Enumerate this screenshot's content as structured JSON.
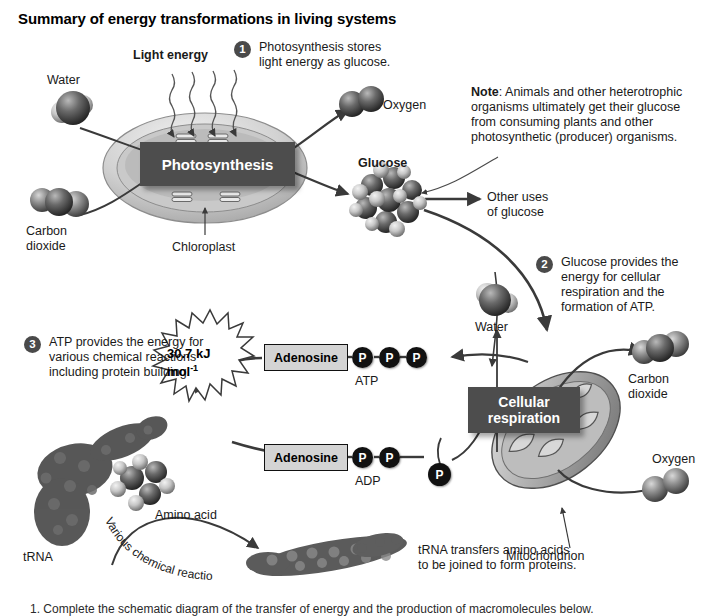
{
  "title": "Summary of energy transformations in living systems",
  "labels": {
    "light_energy": "Light energy",
    "water_top": "Water",
    "carbon_dioxide_top": "Carbon\ndioxide",
    "carbon_dioxide_top_l1": "Carbon",
    "carbon_dioxide_top_l2": "dioxide",
    "photosynthesis": "Photosynthesis",
    "chloroplast": "Chloroplast",
    "oxygen_top": "Oxygen",
    "glucose": "Glucose",
    "other_uses_l1": "Other uses",
    "other_uses_l2": "of glucose",
    "water_mid": "Water",
    "cellular_respiration_l1": "Cellular",
    "cellular_respiration_l2": "respiration",
    "mitochondrion": "Mitochondrion",
    "carbon_dioxide_right_l1": "Carbon",
    "carbon_dioxide_right_l2": "dioxide",
    "oxygen_right": "Oxygen",
    "adenosine_atp": "Adenosine",
    "adenosine_adp": "Adenosine",
    "atp": "ATP",
    "adp": "ADP",
    "phosphate": "P",
    "energy_value_l1": "30.7 kJ",
    "energy_value_l2": "mol",
    "energy_value_sup": "-1",
    "trna": "tRNA",
    "amino_acid": "Amino acid",
    "various_reactions": "Various chemical reactions"
  },
  "steps": [
    {
      "num": "1",
      "lines": [
        "Photosynthesis stores",
        "light energy as glucose."
      ]
    },
    {
      "num": "2",
      "lines": [
        "Glucose provides the",
        "energy for cellular",
        "respiration and the",
        "formation of ATP."
      ]
    },
    {
      "num": "3",
      "lines": [
        "ATP provides the energy for",
        "various chemical reactions",
        "including protein building."
      ]
    }
  ],
  "note": {
    "label": "Note",
    "colon": ":",
    "lines": [
      " Animals and other heterotrophic",
      "organisms ultimately get their glucose",
      "from consuming plants and other",
      "photosynthetic (producer) organisms."
    ]
  },
  "trna_caption": {
    "lines": [
      "tRNA transfers amino acids",
      "to be joined to form proteins."
    ]
  },
  "footer": "1.  Complete the schematic diagram of the transfer of energy and the production of macromolecules below.",
  "colors": {
    "process_box": "#4d4d4d",
    "badge": "#4a4a4a",
    "phosphate": "#111111",
    "adenosine_box": "#d4d4d4",
    "arrow": "#3a3a3a"
  }
}
